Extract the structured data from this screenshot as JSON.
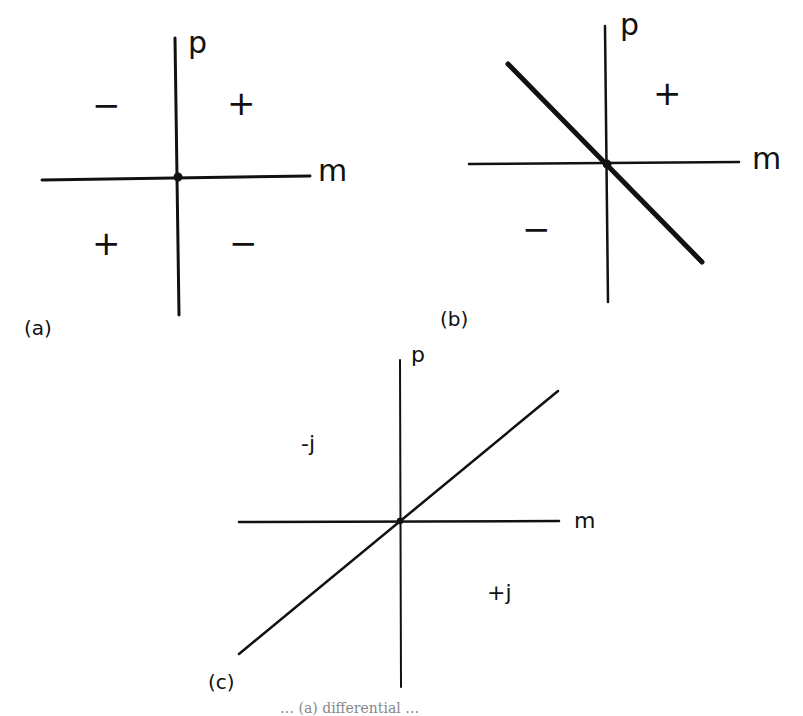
{
  "diagrams": {
    "a": {
      "panel_label": "(a)",
      "axis_x_label": "m",
      "axis_y_label": "p",
      "quadrants": {
        "top_left": "−",
        "top_right": "+",
        "bottom_left": "+",
        "bottom_right": "−"
      }
    },
    "b": {
      "panel_label": "(b)",
      "axis_x_label": "m",
      "axis_y_label": "p",
      "region_above_line": "+",
      "region_below_line": "−",
      "line": "negative-slope diagonal through origin"
    },
    "c": {
      "panel_label": "(c)",
      "axis_x_label": "m",
      "axis_y_label": "p",
      "region_above_line": "-j",
      "region_below_line": "+j",
      "line": "positive-slope diagonal through origin"
    }
  },
  "caption_fragment": "… (a) differential …"
}
